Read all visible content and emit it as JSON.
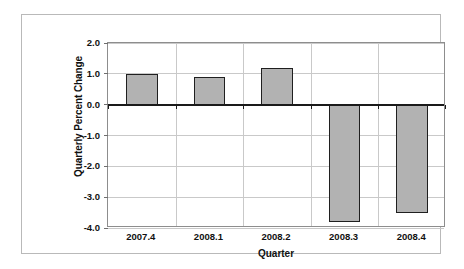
{
  "chart_data": {
    "type": "bar",
    "title": "",
    "categories": [
      "2007.4",
      "2008.1",
      "2008.2",
      "2008.3",
      "2008.4"
    ],
    "values": [
      1.0,
      0.9,
      1.2,
      -3.8,
      -3.5
    ],
    "xlabel": "Quarter",
    "ylabel": "Quarterly Percent Change",
    "ylim": [
      -4.0,
      2.0
    ],
    "ytick_labels": [
      "2.0",
      "1.0",
      "0.0",
      "-1.0",
      "-2.0",
      "-3.0",
      "-4.0"
    ],
    "ytick_values": [
      2.0,
      1.0,
      0.0,
      -1.0,
      -2.0,
      -3.0,
      -4.0
    ],
    "grid": true,
    "legend": false,
    "legend_position": "none",
    "series": [
      {
        "name": "Quarterly Percent Change",
        "values": [
          1.0,
          0.9,
          1.2,
          -3.8,
          -3.5
        ]
      }
    ]
  },
  "style": {
    "bar_fill": "#b2b2b2",
    "bar_border": "#1f1f1f",
    "gridline_color": "#c9c9c9",
    "axis_color": "#8d8d8d",
    "zero_line_color": "#1a1a1a",
    "text_color": "#111111",
    "frame_color": "#b9b9b9",
    "background": "#ffffff"
  }
}
